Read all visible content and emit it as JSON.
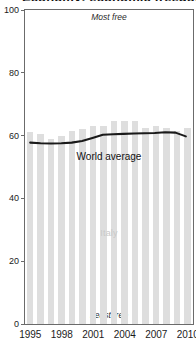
{
  "title": "Economy: economic freedom",
  "annotations": {
    "top": "Most free",
    "bottom": "Least free",
    "bars_label": "Italy",
    "line_label": "World average"
  },
  "chart_data": {
    "type": "bar",
    "title": "Economy: economic freedom",
    "xlabel": "",
    "ylabel": "",
    "ylim": [
      0,
      100
    ],
    "grid": false,
    "legend_position": "inline-annotations",
    "categories": [
      "1995",
      "1996",
      "1997",
      "1998",
      "1999",
      "2000",
      "2001",
      "2002",
      "2003",
      "2004",
      "2005",
      "2006",
      "2007",
      "2008",
      "2009",
      "2010"
    ],
    "xticks": [
      "1995",
      "1998",
      "2001",
      "2004",
      "2007",
      "2010"
    ],
    "yticks": [
      0,
      20,
      40,
      60,
      80,
      100
    ],
    "series": [
      {
        "name": "Italy",
        "type": "bar",
        "color": "#dedede",
        "values": [
          61,
          60.5,
          59,
          60,
          61.5,
          62,
          63,
          63,
          64.5,
          64.5,
          64.5,
          62.5,
          63,
          62.5,
          61.5,
          62.5
        ]
      },
      {
        "name": "World average",
        "type": "line",
        "color": "#1a1a1a",
        "values": [
          57.5,
          57.3,
          57.2,
          57.3,
          57.5,
          58,
          59,
          60,
          60.2,
          60.3,
          60.4,
          60.5,
          60.6,
          60.8,
          60.7,
          59.5
        ]
      }
    ]
  }
}
